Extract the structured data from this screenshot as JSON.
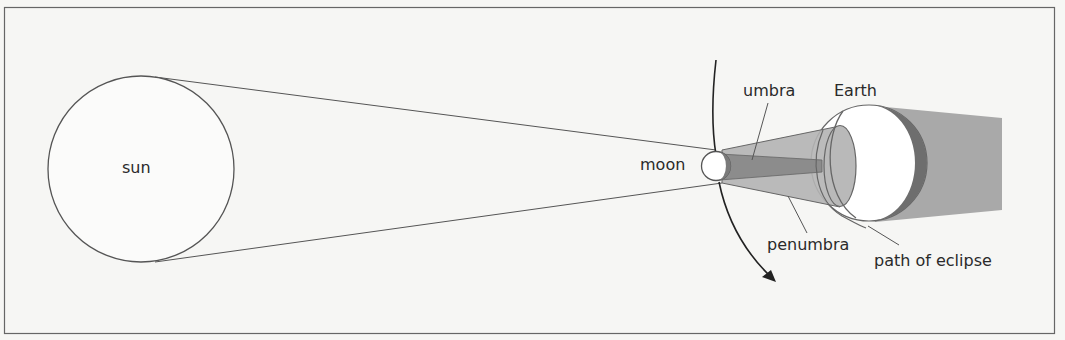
{
  "diagram": {
    "labels": {
      "sun": "sun",
      "moon": "moon",
      "umbra": "umbra",
      "earth": "Earth",
      "penumbra": "penumbra",
      "path": "path of eclipse"
    },
    "colors": {
      "background": "#f6f6f4",
      "line": "#555555",
      "penumbra_fill": "#b4b4b4",
      "umbra_fill": "#8c8c8c",
      "shadow_fill": "#a9a9a9",
      "earth_dark_limb": "#6e6e6e",
      "frame": "#666666"
    }
  }
}
